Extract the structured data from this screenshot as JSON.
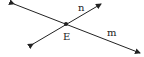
{
  "diagram": {
    "type": "intersecting-lines",
    "lines": [
      {
        "name": "m",
        "label": "m",
        "from": [
          14,
          4
        ],
        "to": [
          140,
          53
        ]
      },
      {
        "name": "n",
        "label": "n",
        "from": [
          33,
          44
        ],
        "to": [
          101,
          4
        ]
      }
    ],
    "point": {
      "label": "E",
      "at": [
        66,
        24
      ]
    },
    "stroke_color": "#222222"
  }
}
